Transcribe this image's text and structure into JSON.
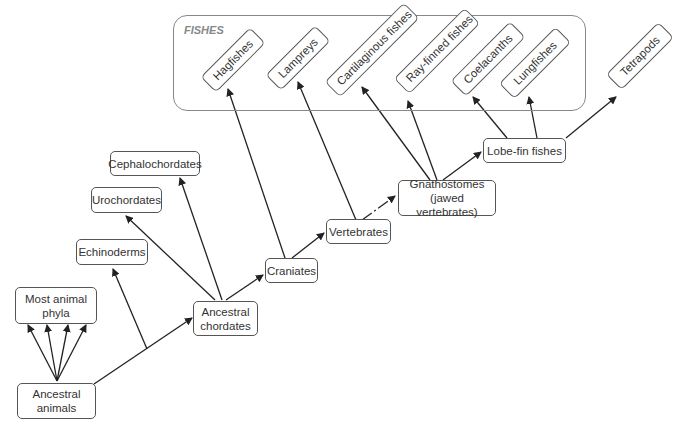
{
  "diagram": {
    "type": "phylogenetic-tree",
    "group": {
      "label": "FISHES"
    },
    "nodes": {
      "ancestral_animals": "Ancestral\nanimals",
      "most_animal_phyla": "Most animal\nphyla",
      "echinoderms": "Echinoderms",
      "urochordates": "Urochordates",
      "cephalochordates": "Cephalochordates",
      "ancestral_chordates": "Ancestral\nchordates",
      "craniates": "Craniates",
      "vertebrates": "Vertebrates",
      "gnathostomes": "Gnathostomes\n(jawed vertebrates)",
      "lobe_fin_fishes": "Lobe-fin fishes",
      "hagfishes": "Hagfishes",
      "lampreys": "Lampreys",
      "cartilaginous_fishes": "Cartilaginous fishes",
      "ray_finned_fishes": "Ray-finned fishes",
      "coelacanths": "Coelacanths",
      "lungfishes": "Lungfishes",
      "tetrapods": "Tetrapods"
    },
    "edges": [
      [
        "Ancestral animals",
        "Most animal phyla"
      ],
      [
        "Ancestral animals",
        "Ancestral chordates"
      ],
      [
        "Ancestral animals",
        "Echinoderms"
      ],
      [
        "Ancestral chordates",
        "Urochordates"
      ],
      [
        "Ancestral chordates",
        "Cephalochordates"
      ],
      [
        "Ancestral chordates",
        "Craniates"
      ],
      [
        "Craniates",
        "Hagfishes"
      ],
      [
        "Craniates",
        "Vertebrates"
      ],
      [
        "Vertebrates",
        "Lampreys"
      ],
      [
        "Vertebrates",
        "Gnathostomes"
      ],
      [
        "Gnathostomes",
        "Cartilaginous fishes"
      ],
      [
        "Gnathostomes",
        "Ray-finned fishes"
      ],
      [
        "Gnathostomes",
        "Lobe-fin fishes"
      ],
      [
        "Lobe-fin fishes",
        "Coelacanths"
      ],
      [
        "Lobe-fin fishes",
        "Lungfishes"
      ],
      [
        "Lobe-fin fishes",
        "Tetrapods"
      ]
    ],
    "colors": {
      "stroke": "#333333",
      "box_border": "#555555",
      "group_border": "#888888",
      "group_label": "#888888"
    }
  }
}
